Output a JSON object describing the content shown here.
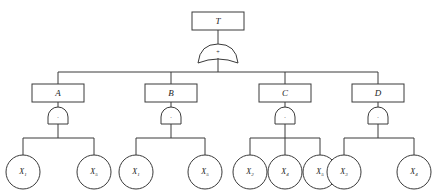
{
  "diagram": {
    "colors": {
      "stroke": "#3a3a3a",
      "text": "#1c1c1c",
      "background": "#ffffff"
    },
    "top_event": {
      "label": "T",
      "gate": {
        "type": "OR",
        "symbol": "+"
      }
    },
    "intermediate_events": [
      {
        "label": "A",
        "gate": {
          "type": "AND",
          "symbol": "·"
        },
        "basic_events": [
          {
            "name": "X",
            "subscript": "1"
          },
          {
            "name": "X",
            "subscript": "5"
          }
        ]
      },
      {
        "label": "B",
        "gate": {
          "type": "AND",
          "symbol": "·"
        },
        "basic_events": [
          {
            "name": "X",
            "subscript": "1"
          },
          {
            "name": "X",
            "subscript": "5"
          }
        ]
      },
      {
        "label": "C",
        "gate": {
          "type": "AND",
          "symbol": "·"
        },
        "basic_events": [
          {
            "name": "X",
            "subscript": "2"
          },
          {
            "name": "X",
            "subscript": "4"
          },
          {
            "name": "X",
            "subscript": "5"
          }
        ]
      },
      {
        "label": "D",
        "gate": {
          "type": "AND",
          "symbol": "·"
        },
        "basic_events": [
          {
            "name": "X",
            "subscript": "3"
          },
          {
            "name": "X",
            "subscript": "4"
          }
        ]
      }
    ]
  }
}
